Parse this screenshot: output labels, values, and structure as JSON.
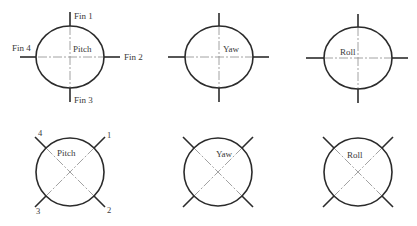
{
  "figure": {
    "colors": {
      "outline": "#2b2b2b",
      "centerline": "#8a8a8a",
      "text": "#3a3a3a",
      "background": "#ffffff"
    },
    "rows": [
      {
        "arrangement": "plus",
        "panels": [
          {
            "mode_label": "Pitch",
            "cx": 70,
            "cy": 57,
            "rx": 34,
            "ry": 31,
            "fin_labels": {
              "top": "Fin 1",
              "right": "Fin 2",
              "bottom": "Fin 3",
              "left": "Fin 4"
            }
          },
          {
            "mode_label": "Yaw",
            "cx": 219,
            "cy": 57,
            "rx": 34,
            "ry": 31
          },
          {
            "mode_label": "Roll",
            "cx": 358,
            "cy": 58,
            "rx": 34,
            "ry": 31
          }
        ]
      },
      {
        "arrangement": "cross",
        "panels": [
          {
            "mode_label": "Pitch",
            "cx": 70,
            "cy": 172,
            "r": 34,
            "fin_labels": {
              "top_right": "1",
              "bottom_right": "2",
              "bottom_left": "3",
              "top_left": "4"
            }
          },
          {
            "mode_label": "Yaw",
            "cx": 218,
            "cy": 172,
            "r": 34
          },
          {
            "mode_label": "Roll",
            "cx": 358,
            "cy": 172,
            "r": 34
          }
        ]
      }
    ]
  }
}
